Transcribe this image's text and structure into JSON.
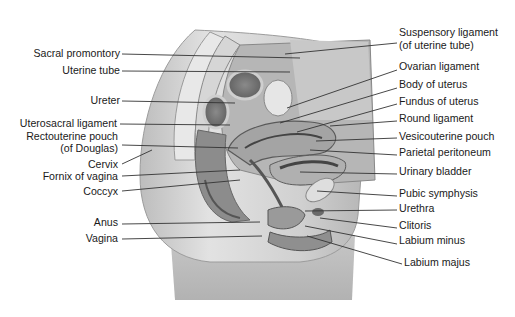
{
  "diagram": {
    "left_labels": [
      {
        "text": "Sacral promontory",
        "right": 120,
        "y": 53,
        "line": [
          122,
          54,
          300,
          58
        ]
      },
      {
        "text": "Uterine tube",
        "right": 120,
        "y": 70,
        "line": [
          122,
          71,
          290,
          72
        ]
      },
      {
        "text": "Ureter",
        "right": 120,
        "y": 100,
        "line": [
          122,
          101,
          235,
          103
        ]
      },
      {
        "text": "Uterosacral ligament",
        "right": 117,
        "y": 123,
        "line": [
          120,
          124,
          230,
          125
        ]
      },
      {
        "text": "Rectouterine pouch",
        "right": 118,
        "y": 136,
        "line": null
      },
      {
        "text": "(of Douglas)",
        "right": 118,
        "y": 148,
        "line": [
          122,
          145,
          238,
          148
        ]
      },
      {
        "text": "Cervix",
        "right": 118,
        "y": 164,
        "line": [
          122,
          164,
          152,
          150
        ]
      },
      {
        "text": "Fornix of vagina",
        "right": 118,
        "y": 176,
        "line": [
          122,
          176,
          240,
          170
        ]
      },
      {
        "text": "Coccyx",
        "right": 118,
        "y": 191,
        "line": [
          122,
          191,
          240,
          180
        ]
      },
      {
        "text": "Anus",
        "right": 118,
        "y": 222,
        "line": [
          122,
          224,
          260,
          222
        ]
      },
      {
        "text": "Vagina",
        "right": 118,
        "y": 238,
        "line": [
          122,
          239,
          262,
          236
        ]
      }
    ],
    "right_labels": [
      {
        "text": "Suspensory ligament",
        "x": 399,
        "y": 32
      },
      {
        "text": "(of uterine tube)",
        "x": 399,
        "y": 45,
        "line": [
          397,
          43,
          285,
          54
        ]
      },
      {
        "text": "Ovarian ligament",
        "x": 399,
        "y": 66,
        "line": [
          397,
          70,
          287,
          108
        ]
      },
      {
        "text": "Body of uterus",
        "x": 399,
        "y": 84,
        "line": [
          397,
          88,
          280,
          123
        ]
      },
      {
        "text": "Fundus of uterus",
        "x": 399,
        "y": 101,
        "line": [
          397,
          104,
          297,
          132
        ]
      },
      {
        "text": "Round ligament",
        "x": 399,
        "y": 118,
        "line": [
          397,
          121,
          330,
          126
        ]
      },
      {
        "text": "Vesicouterine pouch",
        "x": 399,
        "y": 136,
        "line": [
          397,
          138,
          316,
          141
        ]
      },
      {
        "text": "Parietal peritoneum",
        "x": 399,
        "y": 152,
        "line": [
          397,
          155,
          310,
          150
        ]
      },
      {
        "text": "Urinary bladder",
        "x": 399,
        "y": 171,
        "line": [
          397,
          174,
          300,
          172
        ]
      },
      {
        "text": "Pubic symphysis",
        "x": 399,
        "y": 193,
        "line": [
          397,
          196,
          317,
          191
        ]
      },
      {
        "text": "Urethra",
        "x": 399,
        "y": 208,
        "line": [
          397,
          210,
          305,
          211
        ]
      },
      {
        "text": "Clitoris",
        "x": 399,
        "y": 225,
        "line": [
          397,
          228,
          320,
          218
        ]
      },
      {
        "text": "Labium minus",
        "x": 399,
        "y": 240,
        "line": [
          397,
          244,
          305,
          226
        ]
      },
      {
        "text": "Labium majus",
        "x": 404,
        "y": 262,
        "line": [
          402,
          264,
          307,
          236
        ]
      }
    ],
    "colors": {
      "label_text": "#1a1a1a",
      "leader_line": "#333333",
      "body_outer": "#cfcfcf",
      "body_shadow": "#a8a8a8",
      "bone": "#e4e4e4",
      "organ_dark": "#6e6e6e",
      "organ_mid": "#9a9a9a",
      "organ_light": "#c4c4c4"
    }
  }
}
